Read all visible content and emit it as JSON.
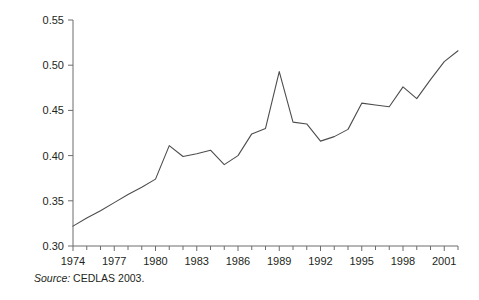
{
  "chart_data": {
    "type": "line",
    "title": "",
    "xlabel": "",
    "ylabel": "Gini coefficient",
    "xlim": [
      1974,
      2002
    ],
    "ylim": [
      0.3,
      0.55
    ],
    "ytick_labels": [
      "0.55",
      "0.50",
      "0.45",
      "0.40",
      "0.35",
      "0.30"
    ],
    "ytick_values": [
      0.55,
      0.5,
      0.45,
      0.4,
      0.35,
      0.3
    ],
    "xtick_labels": [
      "1974",
      "1977",
      "1980",
      "1983",
      "1986",
      "1989",
      "1992",
      "1995",
      "1998",
      "2001"
    ],
    "xtick_values": [
      1974,
      1977,
      1980,
      1983,
      1986,
      1989,
      1992,
      1995,
      1998,
      2001
    ],
    "minor_xticks": [
      1975,
      1976,
      1978,
      1979,
      1981,
      1982,
      1984,
      1985,
      1987,
      1988,
      1990,
      1991,
      1993,
      1994,
      1996,
      1997,
      1999,
      2000,
      2002
    ],
    "grid": false,
    "legend": null,
    "line_color": "#4d4d4d",
    "x": [
      1974,
      1975,
      1976,
      1977,
      1978,
      1979,
      1980,
      1981,
      1982,
      1983,
      1984,
      1985,
      1986,
      1987,
      1988,
      1989,
      1990,
      1991,
      1992,
      1993,
      1994,
      1995,
      1996,
      1997,
      1998,
      1999,
      2000,
      2001,
      2002
    ],
    "values": [
      0.322,
      0.331,
      0.339,
      0.348,
      0.357,
      0.365,
      0.374,
      0.411,
      0.399,
      0.402,
      0.406,
      0.39,
      0.4,
      0.424,
      0.43,
      0.493,
      0.437,
      0.435,
      0.416,
      0.421,
      0.429,
      0.458,
      0.456,
      0.454,
      0.476,
      0.463,
      0.484,
      0.504,
      0.516
    ],
    "series_name": "Gini coefficient",
    "annotations": []
  },
  "figure": {
    "source_prefix": "Source:",
    "source_text": "CEDLAS 2003."
  }
}
